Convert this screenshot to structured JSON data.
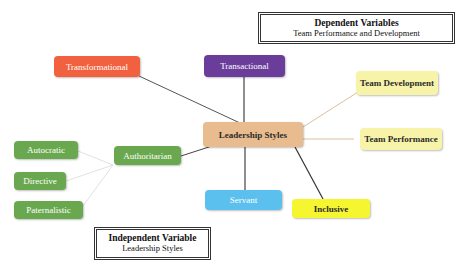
{
  "diagram": {
    "title_boxes": {
      "dependent": {
        "title": "Dependent Variables",
        "subtitle": "Team Performance and Development"
      },
      "independent": {
        "title": "Independent Variable",
        "subtitle": "Leadership Styles"
      }
    },
    "central_node": {
      "label": "Leadership Styles",
      "color": "#e8bc8e"
    },
    "leadership_styles": [
      {
        "label": "Transformational",
        "color": "#f2613f"
      },
      {
        "label": "Transactional",
        "color": "#6a3d9a"
      },
      {
        "label": "Authoritarian",
        "color": "#6aa84f"
      },
      {
        "label": "Servant",
        "color": "#5bc0ee"
      },
      {
        "label": "Inclusive",
        "color": "#f5f530"
      }
    ],
    "authoritarian_substyles": [
      {
        "label": "Autocratic",
        "color": "#6aa84f"
      },
      {
        "label": "Directive",
        "color": "#6aa84f"
      },
      {
        "label": "Paternalistic",
        "color": "#6aa84f"
      }
    ],
    "outcomes": [
      {
        "label": "Team Development",
        "color": "#f7f3a8"
      },
      {
        "label": "Team Performance",
        "color": "#f7f3a8"
      }
    ],
    "line_colors": {
      "dark": "#444444",
      "light": "#d8c8b0",
      "faint": "#cfd8cf"
    }
  }
}
